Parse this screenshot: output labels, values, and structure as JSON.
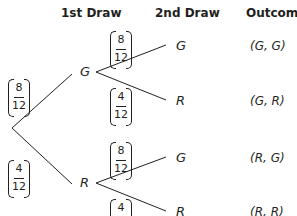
{
  "headers": {
    "first": "1st Draw",
    "second": "2nd Draw",
    "outcome": "Outcome"
  },
  "first_draw": [
    {
      "label": "G",
      "prob": {
        "num": "8",
        "den": "12"
      }
    },
    {
      "label": "R",
      "prob": {
        "num": "4",
        "den": "12"
      }
    }
  ],
  "second_draw": [
    {
      "label": "G",
      "prob": {
        "num": "8",
        "den": "12"
      },
      "outcome": "(G, G)"
    },
    {
      "label": "R",
      "prob": {
        "num": "4",
        "den": "12"
      },
      "outcome": "(G, R)"
    },
    {
      "label": "G",
      "prob": {
        "num": "8",
        "den": "12"
      },
      "outcome": "(R, G)"
    },
    {
      "label": "R",
      "prob": {
        "num": "4",
        "den": "12"
      },
      "outcome": "(R, R)"
    }
  ]
}
